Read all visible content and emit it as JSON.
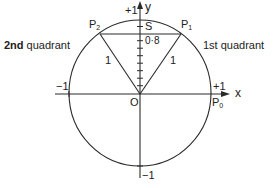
{
  "diagram": {
    "axes": {
      "x_label": "x",
      "y_label": "y",
      "x_pos_tick": "+1",
      "x_neg_tick": "−1",
      "y_pos_tick": "+1",
      "y_neg_tick": "−1"
    },
    "origin_label": "O",
    "points": {
      "p0": {
        "name": "P",
        "sub": "0"
      },
      "p1": {
        "name": "P",
        "sub": "1"
      },
      "p2": {
        "name": "P",
        "sub": "2"
      },
      "s": {
        "name": "S"
      }
    },
    "segment_labels": {
      "op1_length": "1",
      "op2_length": "1",
      "os_value": "0·8"
    },
    "quadrants": {
      "first": "1st quadrant",
      "second_num": "2nd",
      "second_rest": " quadrant"
    },
    "y_axis_tick_count": 8,
    "colors": {
      "stroke": "#2a2a2a",
      "background": "#ffffff"
    }
  }
}
